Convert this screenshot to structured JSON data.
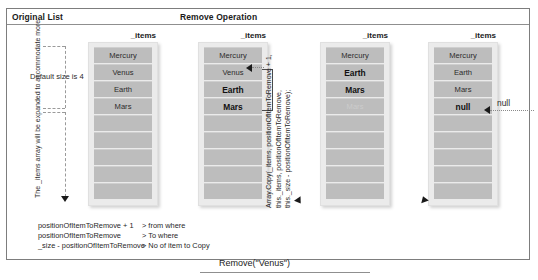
{
  "diagram": {
    "section_titles": {
      "original": "Original List",
      "remove": "Remove Operation"
    },
    "array_label": "_items",
    "default_size_label": "Default size is 4",
    "expand_note": "The _items array will be expanded to accommodate more",
    "expand_note_bold_part": "_items",
    "code_note_lines": [
      "Array.Copy(_items, positionOfItemToRemove + 1,",
      "this._items,  positionOfItemToRemove,",
      "this._size -  positionOfItemToRemove);"
    ],
    "null_callout": "null",
    "caption": "Remove(\"Venus\")",
    "legend": [
      {
        "term": "positionOfItemToRemove + 1",
        "desc": "> from where"
      },
      {
        "term": "positionOfItemToRemove",
        "desc": "> To where"
      },
      {
        "term": "_size - positionOfItemToRemove",
        "desc": "> No of item to Copy"
      }
    ],
    "columns": [
      {
        "id": "original",
        "header": "_items",
        "cells": [
          {
            "text": "Mercury",
            "style": "filled"
          },
          {
            "text": "Venus",
            "style": "filled"
          },
          {
            "text": "Earth",
            "style": "filled"
          },
          {
            "text": "Mars",
            "style": "filled"
          },
          {
            "text": "",
            "style": "empty"
          },
          {
            "text": "",
            "style": "empty"
          },
          {
            "text": "",
            "style": "empty"
          },
          {
            "text": "",
            "style": "empty"
          },
          {
            "text": "",
            "style": "empty"
          }
        ]
      },
      {
        "id": "step1",
        "header": "_items",
        "cells": [
          {
            "text": "Mercury",
            "style": "filled"
          },
          {
            "text": "Venus",
            "style": "filled"
          },
          {
            "text": "Earth",
            "style": "bold"
          },
          {
            "text": "Mars",
            "style": "bold"
          },
          {
            "text": "",
            "style": "empty"
          },
          {
            "text": "",
            "style": "empty"
          },
          {
            "text": "",
            "style": "empty"
          },
          {
            "text": "",
            "style": "empty"
          },
          {
            "text": "",
            "style": "empty"
          }
        ]
      },
      {
        "id": "step2",
        "header": "_items",
        "cells": [
          {
            "text": "Mercury",
            "style": "filled"
          },
          {
            "text": "Earth",
            "style": "bold"
          },
          {
            "text": "Mars",
            "style": "bold"
          },
          {
            "text": "Mars",
            "style": "faint"
          },
          {
            "text": "",
            "style": "empty"
          },
          {
            "text": "",
            "style": "empty"
          },
          {
            "text": "",
            "style": "empty"
          },
          {
            "text": "",
            "style": "empty"
          },
          {
            "text": "",
            "style": "empty"
          }
        ]
      },
      {
        "id": "step3",
        "header": "_items",
        "cells": [
          {
            "text": "Mercury",
            "style": "filled"
          },
          {
            "text": "Earth",
            "style": "filled"
          },
          {
            "text": "Mars",
            "style": "filled"
          },
          {
            "text": "null",
            "style": "bold"
          },
          {
            "text": "",
            "style": "empty"
          },
          {
            "text": "",
            "style": "empty"
          },
          {
            "text": "",
            "style": "empty"
          },
          {
            "text": "",
            "style": "empty"
          },
          {
            "text": "",
            "style": "empty"
          }
        ]
      }
    ],
    "colors": {
      "cell_fill": "#bdbdbd",
      "panel_fill": "#ebebeb",
      "frame_border": "#7d7d7d",
      "text": "#1a1a1a"
    }
  }
}
